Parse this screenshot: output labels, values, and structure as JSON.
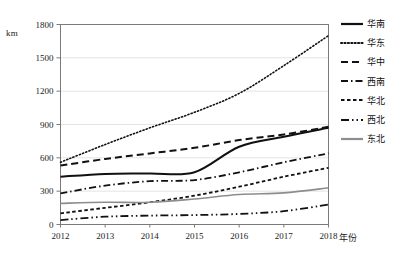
{
  "chart_data": {
    "type": "line",
    "title": "",
    "xlabel": "年份",
    "ylabel": "km",
    "x": [
      2012,
      2013,
      2014,
      2015,
      2016,
      2017,
      2018
    ],
    "xtick_labels": [
      "2012",
      "2013",
      "2014",
      "2015",
      "2016",
      "2017",
      "2018"
    ],
    "ytick_labels": [
      "0",
      "300",
      "600",
      "900",
      "1200",
      "1500",
      "1800"
    ],
    "yticks": [
      0,
      300,
      600,
      900,
      1200,
      1500,
      1800
    ],
    "ylim": [
      0,
      1800
    ],
    "xlim": [
      2012,
      2018
    ],
    "grid": true,
    "legend_position": "right",
    "series": [
      {
        "name": "华南",
        "style": "solid",
        "color": "#111111",
        "width": 2.0,
        "values": [
          430,
          455,
          460,
          470,
          700,
          790,
          870
        ]
      },
      {
        "name": "华东",
        "style": "dotted",
        "color": "#111111",
        "width": 1.6,
        "values": [
          560,
          720,
          870,
          1010,
          1180,
          1430,
          1700
        ]
      },
      {
        "name": "华中",
        "style": "dashed",
        "color": "#111111",
        "width": 2.0,
        "values": [
          530,
          590,
          640,
          690,
          760,
          810,
          880
        ]
      },
      {
        "name": "西南",
        "style": "dashdot",
        "color": "#111111",
        "width": 1.8,
        "values": [
          280,
          350,
          390,
          400,
          470,
          560,
          640
        ]
      },
      {
        "name": "华北",
        "style": "shortdash",
        "color": "#111111",
        "width": 1.8,
        "values": [
          100,
          150,
          200,
          260,
          340,
          430,
          510
        ]
      },
      {
        "name": "西北",
        "style": "dashdotdot",
        "color": "#111111",
        "width": 1.8,
        "values": [
          40,
          70,
          80,
          85,
          95,
          120,
          180
        ]
      },
      {
        "name": "东北",
        "style": "solid",
        "color": "#8d8d8d",
        "width": 1.6,
        "values": [
          190,
          200,
          200,
          230,
          270,
          285,
          330
        ]
      }
    ]
  },
  "legend": {
    "items": [
      {
        "label": "华南",
        "style": "solid",
        "color": "#111111"
      },
      {
        "label": "华东",
        "style": "dotted",
        "color": "#111111"
      },
      {
        "label": "华中",
        "style": "dashed",
        "color": "#111111"
      },
      {
        "label": "西南",
        "style": "dashdot",
        "color": "#111111"
      },
      {
        "label": "华北",
        "style": "shortdash",
        "color": "#111111"
      },
      {
        "label": "西北",
        "style": "dashdotdot",
        "color": "#111111"
      },
      {
        "label": "东北",
        "style": "solid",
        "color": "#8d8d8d"
      }
    ]
  },
  "axis": {
    "unit_label": "km",
    "x_title": "年份"
  },
  "colors": {
    "frame": "#7a7a7a",
    "grid": "#e4e4e4",
    "primary_line": "#111111",
    "secondary_line": "#8d8d8d",
    "text": "#1a1a1a"
  }
}
